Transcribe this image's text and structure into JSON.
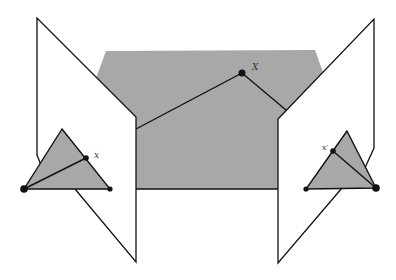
{
  "diagram": {
    "colors": {
      "plane_fill": "#ffffff",
      "epipolar_plane_fill": "#a8a8a8",
      "stroke": "#111111"
    },
    "labels": {
      "world_point": "X",
      "left_image_point": "x",
      "right_image_point": "x′"
    }
  }
}
